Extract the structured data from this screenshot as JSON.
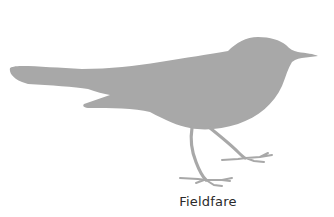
{
  "figure": {
    "caption": "Fieldfare",
    "colors": {
      "background": "#ffffff",
      "silhouette": "#a8a8a8",
      "caption_text": "#2a2a2a"
    }
  }
}
